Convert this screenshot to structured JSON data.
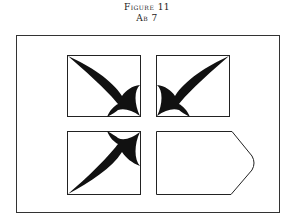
{
  "caption": {
    "title": "Figure 11",
    "subtitle": "Ab 7"
  },
  "diagram": {
    "stroke_color": "#1a1a1a",
    "fill_color": "#111111",
    "panels": [
      {
        "position": "top-left",
        "content": "leaf shape pointing to upper-left corner with curved base at bottom-right"
      },
      {
        "position": "top-right",
        "content": "leaf shape pointing to upper-right corner with curved base at bottom-left"
      },
      {
        "position": "bottom-left",
        "content": "leaf shape pointing to lower-left corner with curved base at top-right"
      },
      {
        "position": "bottom-right",
        "content": "empty pentagon-like panel with pointed right edge"
      }
    ]
  }
}
